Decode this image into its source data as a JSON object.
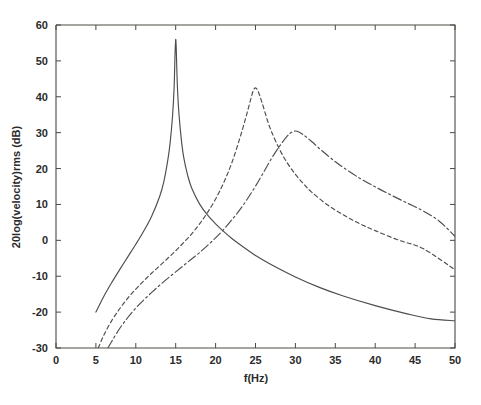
{
  "chart_data": {
    "type": "line",
    "title": "",
    "subtitle": "",
    "xlabel": "f(Hz)",
    "ylabel": "20log(velocity)rms (dB)",
    "xlim": [
      0,
      50
    ],
    "ylim": [
      -30,
      60
    ],
    "xticks": [
      0,
      5,
      10,
      15,
      20,
      25,
      30,
      35,
      40,
      45,
      50
    ],
    "xtick_labels": [
      "0",
      "5",
      "10",
      "15",
      "20",
      "25",
      "30",
      "35",
      "40",
      "45",
      "50"
    ],
    "yticks": [
      -30,
      -20,
      -10,
      0,
      10,
      20,
      30,
      40,
      50,
      60
    ],
    "ytick_labels": [
      "-30",
      "-20",
      "-10",
      "0",
      "10",
      "20",
      "30",
      "40",
      "50",
      "60"
    ],
    "grid": false,
    "legend": "none",
    "line_color": "#4d4d4d",
    "background": "#ffffff",
    "series": [
      {
        "name": "resonance-15hz",
        "style": "solid",
        "dasharray": "",
        "peak_x": 15,
        "peak_y": 56,
        "x": [
          5,
          6,
          7,
          8,
          9,
          10,
          11,
          12,
          13,
          13.5,
          14,
          14.3,
          14.6,
          14.8,
          15,
          15.2,
          15.4,
          15.7,
          16,
          16.5,
          17,
          18,
          19,
          20,
          21,
          22,
          23,
          24,
          25,
          27,
          30,
          33,
          36,
          40,
          44,
          47,
          50
        ],
        "values": [
          -20,
          -15.6,
          -11.7,
          -8.1,
          -4.6,
          -1.1,
          2.6,
          6.8,
          12.3,
          16.2,
          22.2,
          27.1,
          34.5,
          42.5,
          56,
          43.5,
          35.5,
          28.2,
          23.2,
          18.1,
          14.6,
          10.1,
          7,
          4.6,
          2.5,
          0.6,
          -1.1,
          -2.7,
          -4.2,
          -6.8,
          -10.2,
          -13.1,
          -15.5,
          -18.2,
          -20.5,
          -21.9,
          -22.4
        ]
      },
      {
        "name": "resonance-25hz",
        "style": "dashed",
        "dasharray": "4,3",
        "peak_x": 25,
        "peak_y": 42.5,
        "x": [
          5.3,
          6,
          7,
          8,
          9,
          10,
          11,
          12,
          13,
          14,
          15,
          16,
          17,
          18,
          19,
          20,
          21,
          22,
          23,
          23.8,
          24.4,
          24.8,
          25.2,
          25.8,
          26.5,
          27,
          28,
          29,
          30,
          31,
          32,
          34,
          36,
          38,
          40,
          43,
          46,
          50
        ],
        "values": [
          -30,
          -26.4,
          -22.3,
          -19,
          -16.1,
          -13.6,
          -11.3,
          -9.1,
          -7.1,
          -5,
          -2.9,
          -0.6,
          1.8,
          4.6,
          7.8,
          11.5,
          16,
          21.4,
          28.2,
          34.3,
          39.3,
          42.1,
          42.1,
          38.5,
          33.4,
          30.3,
          25.4,
          21.5,
          18.4,
          15.8,
          13.5,
          9.9,
          7.1,
          4.7,
          2.7,
          0,
          -2.3,
          -8.2
        ]
      },
      {
        "name": "resonance-30hz",
        "style": "dash-dot",
        "dasharray": "9,3,2,3",
        "peak_x": 30,
        "peak_y": 30.5,
        "x": [
          6.5,
          7,
          8,
          9,
          10,
          11,
          12,
          13,
          14,
          15,
          16,
          17,
          18,
          19,
          20,
          21,
          22,
          23,
          24,
          25,
          26,
          27,
          28,
          29,
          29.6,
          30.2,
          31,
          32,
          33,
          34,
          35,
          36,
          38,
          40,
          42,
          44,
          46,
          48,
          50
        ],
        "values": [
          -30,
          -28.1,
          -24.5,
          -21.5,
          -18.9,
          -16.6,
          -14.5,
          -12.5,
          -10.6,
          -8.8,
          -7,
          -5.2,
          -3.4,
          -1.4,
          0.7,
          3,
          5.6,
          8.4,
          11.6,
          15.1,
          18.9,
          22.8,
          26.2,
          29.1,
          30.2,
          30.4,
          29.4,
          27.6,
          25.6,
          23.7,
          21.9,
          20.3,
          17.4,
          14.9,
          12.6,
          10.4,
          8.2,
          5.4,
          1.1
        ]
      }
    ]
  }
}
